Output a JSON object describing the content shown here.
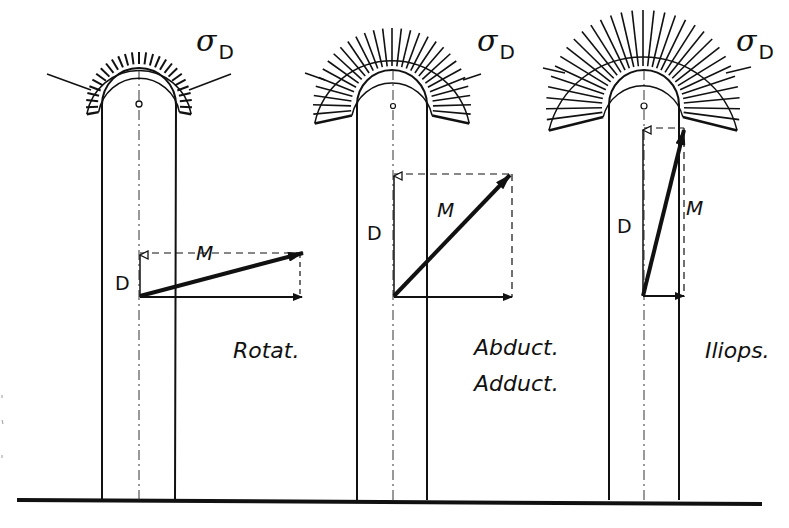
{
  "figure": {
    "panels": [
      {
        "id": "rotat",
        "sigma_symbol": "σ",
        "sigma_subscript": "D",
        "resultant_label": "M",
        "vertical_label": "D",
        "caption_lines": [
          "Rotat."
        ]
      },
      {
        "id": "abduct",
        "sigma_symbol": "σ",
        "sigma_subscript": "D",
        "resultant_label": "M",
        "vertical_label": "D",
        "caption_lines": [
          "Abduct.",
          "Adduct."
        ]
      },
      {
        "id": "iliops",
        "sigma_symbol": "σ",
        "sigma_subscript": "D",
        "resultant_label": "M",
        "vertical_label": "D",
        "caption_lines": [
          "Iliops."
        ]
      }
    ],
    "colors": {
      "ink": "#111111",
      "background": "#ffffff"
    }
  }
}
